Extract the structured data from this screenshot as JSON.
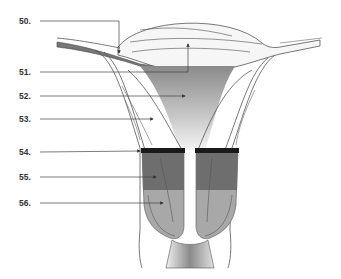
{
  "diagram": {
    "labels": [
      {
        "number": "50.",
        "y": 16
      },
      {
        "number": "51.",
        "y": 67
      },
      {
        "number": "52.",
        "y": 91
      },
      {
        "number": "53.",
        "y": 114
      },
      {
        "number": "54.",
        "y": 147
      },
      {
        "number": "55.",
        "y": 172
      },
      {
        "number": "56.",
        "y": 198
      }
    ]
  },
  "colors": {
    "line": "#555555",
    "dark_band": "#1a1a1a",
    "dark_gray": "#6e6e6e",
    "mid_gray": "#a8a8a8",
    "light_fill": "#f0f0f0"
  }
}
